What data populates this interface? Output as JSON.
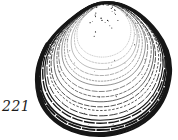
{
  "figure": {
    "label": "221",
    "illustration": "clam-shell-line-drawing"
  },
  "colors": {
    "background": "#ffffff",
    "ink": "#161616"
  }
}
